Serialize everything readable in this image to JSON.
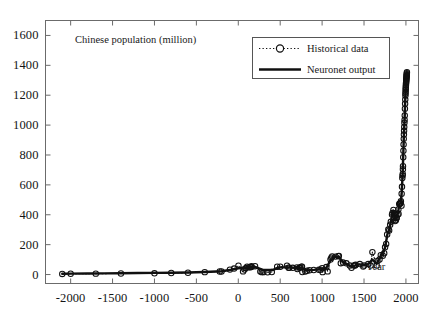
{
  "figure": {
    "background_color": "#ffffff",
    "axes_color": "#6b6b6b",
    "data_color": "#101010"
  },
  "chart_data": {
    "type": "line",
    "title": "Chinese population (million)",
    "xlabel": "Year",
    "ylabel": "",
    "xlim": [
      -2300,
      2150
    ],
    "ylim": [
      -60,
      1700
    ],
    "xticks": [
      -2000,
      -1500,
      -1000,
      -500,
      0,
      500,
      1000,
      1500,
      2000
    ],
    "xtick_labels": [
      "-2000",
      "-1500",
      "-1000",
      "-500",
      "0",
      "500",
      "1000",
      "1500",
      "2000"
    ],
    "yticks": [
      0,
      200,
      400,
      600,
      800,
      1000,
      1200,
      1400,
      1600
    ],
    "ytick_labels": [
      "0",
      "200",
      "400",
      "600",
      "800",
      "1000",
      "1200",
      "1400",
      "1600"
    ],
    "grid": false,
    "legend_position": "upper right",
    "legend": [
      {
        "name": "Historical data",
        "style": "dotted-line-with-circle-markers"
      },
      {
        "name": "Neuronet output",
        "style": "thick-solid-line"
      }
    ],
    "series": [
      {
        "name": "Historical data",
        "marker": "o",
        "linestyle": ":",
        "points": [
          [
            -2100,
            4
          ],
          [
            -2000,
            5
          ],
          [
            -1700,
            6
          ],
          [
            -1400,
            7
          ],
          [
            -1000,
            8
          ],
          [
            -800,
            10
          ],
          [
            -600,
            12
          ],
          [
            -400,
            16
          ],
          [
            -221,
            20
          ],
          [
            -200,
            20
          ],
          [
            -100,
            33
          ],
          [
            -50,
            40
          ],
          [
            2,
            59
          ],
          [
            57,
            21
          ],
          [
            75,
            34
          ],
          [
            88,
            43
          ],
          [
            105,
            53
          ],
          [
            125,
            48
          ],
          [
            140,
            49
          ],
          [
            156,
            50
          ],
          [
            157,
            56
          ],
          [
            200,
            56
          ],
          [
            263,
            21
          ],
          [
            280,
            16
          ],
          [
            300,
            16
          ],
          [
            350,
            15
          ],
          [
            400,
            17
          ],
          [
            464,
            52
          ],
          [
            500,
            52
          ],
          [
            581,
            59
          ],
          [
            600,
            46
          ],
          [
            609,
            46
          ],
          [
            650,
            45
          ],
          [
            700,
            48
          ],
          [
            705,
            37
          ],
          [
            732,
            45
          ],
          [
            740,
            48
          ],
          [
            755,
            52
          ],
          [
            760,
            53
          ],
          [
            764,
            17
          ],
          [
            800,
            20
          ],
          [
            820,
            25
          ],
          [
            850,
            29
          ],
          [
            900,
            30
          ],
          [
            961,
            32
          ],
          [
            980,
            32
          ],
          [
            1000,
            43
          ],
          [
            1006,
            16
          ],
          [
            1050,
            50
          ],
          [
            1066,
            21
          ],
          [
            1100,
            100
          ],
          [
            1110,
            112
          ],
          [
            1120,
            121
          ],
          [
            1160,
            120
          ],
          [
            1193,
            123
          ],
          [
            1200,
            125
          ],
          [
            1223,
            76
          ],
          [
            1250,
            80
          ],
          [
            1290,
            75
          ],
          [
            1330,
            60
          ],
          [
            1351,
            45
          ],
          [
            1381,
            60
          ],
          [
            1393,
            60
          ],
          [
            1400,
            65
          ],
          [
            1450,
            70
          ],
          [
            1491,
            53
          ],
          [
            1500,
            60
          ],
          [
            1550,
            70
          ],
          [
            1578,
            60
          ],
          [
            1600,
            150
          ],
          [
            1651,
            60
          ],
          [
            1661,
            91
          ],
          [
            1685,
            101
          ],
          [
            1700,
            130
          ],
          [
            1724,
            126
          ],
          [
            1741,
            143
          ],
          [
            1751,
            182
          ],
          [
            1764,
            205
          ],
          [
            1776,
            268
          ],
          [
            1790,
            301
          ],
          [
            1800,
            295
          ],
          [
            1812,
            333
          ],
          [
            1820,
            353
          ],
          [
            1834,
            401
          ],
          [
            1840,
            412
          ],
          [
            1851,
            432
          ],
          [
            1860,
            410
          ],
          [
            1870,
            358
          ],
          [
            1880,
            364
          ],
          [
            1887,
            377
          ],
          [
            1890,
            380
          ],
          [
            1900,
            400
          ],
          [
            1910,
            436
          ],
          [
            1912,
            405
          ],
          [
            1920,
            472
          ],
          [
            1928,
            474
          ],
          [
            1931,
            475
          ],
          [
            1936,
            479
          ],
          [
            1940,
            490
          ],
          [
            1947,
            461
          ],
          [
            1949,
            541
          ],
          [
            1953,
            587
          ],
          [
            1957,
            646
          ],
          [
            1960,
            662
          ],
          [
            1962,
            673
          ],
          [
            1964,
            705
          ],
          [
            1965,
            725
          ],
          [
            1968,
            785
          ],
          [
            1970,
            829
          ],
          [
            1972,
            871
          ],
          [
            1974,
            908
          ],
          [
            1976,
            937
          ],
          [
            1978,
            962
          ],
          [
            1980,
            987
          ],
          [
            1982,
            1016
          ],
          [
            1984,
            1034
          ],
          [
            1986,
            1065
          ],
          [
            1988,
            1110
          ],
          [
            1990,
            1143
          ],
          [
            1992,
            1171
          ],
          [
            1994,
            1198
          ],
          [
            1995,
            1211
          ],
          [
            1996,
            1223
          ],
          [
            1997,
            1236
          ],
          [
            1998,
            1247
          ],
          [
            1999,
            1257
          ],
          [
            2000,
            1267
          ],
          [
            2001,
            1276
          ],
          [
            2002,
            1284
          ],
          [
            2003,
            1292
          ],
          [
            2004,
            1299
          ],
          [
            2005,
            1307
          ],
          [
            2006,
            1314
          ],
          [
            2007,
            1321
          ],
          [
            2008,
            1328
          ],
          [
            2009,
            1334
          ],
          [
            2010,
            1340
          ],
          [
            2011,
            1347
          ],
          [
            2012,
            1354
          ]
        ]
      },
      {
        "name": "Neuronet output",
        "marker": "none",
        "linestyle": "-",
        "points": [
          [
            -2100,
            5
          ],
          [
            -2000,
            6
          ],
          [
            -1800,
            7
          ],
          [
            -1600,
            8
          ],
          [
            -1400,
            9
          ],
          [
            -1200,
            10
          ],
          [
            -1000,
            11
          ],
          [
            -800,
            12
          ],
          [
            -600,
            14
          ],
          [
            -400,
            17
          ],
          [
            -200,
            22
          ],
          [
            -100,
            30
          ],
          [
            0,
            42
          ],
          [
            100,
            47
          ],
          [
            200,
            51
          ],
          [
            300,
            30
          ],
          [
            400,
            30
          ],
          [
            500,
            48
          ],
          [
            600,
            48
          ],
          [
            700,
            44
          ],
          [
            750,
            48
          ],
          [
            800,
            28
          ],
          [
            900,
            31
          ],
          [
            1000,
            38
          ],
          [
            1050,
            45
          ],
          [
            1100,
            95
          ],
          [
            1150,
            118
          ],
          [
            1200,
            120
          ],
          [
            1250,
            82
          ],
          [
            1300,
            68
          ],
          [
            1350,
            52
          ],
          [
            1400,
            62
          ],
          [
            1450,
            68
          ],
          [
            1500,
            62
          ],
          [
            1550,
            70
          ],
          [
            1600,
            100
          ],
          [
            1650,
            72
          ],
          [
            1700,
            122
          ],
          [
            1750,
            178
          ],
          [
            1780,
            272
          ],
          [
            1800,
            300
          ],
          [
            1820,
            352
          ],
          [
            1840,
            410
          ],
          [
            1850,
            428
          ],
          [
            1860,
            408
          ],
          [
            1870,
            362
          ],
          [
            1880,
            368
          ],
          [
            1890,
            382
          ],
          [
            1900,
            402
          ],
          [
            1910,
            432
          ],
          [
            1920,
            468
          ],
          [
            1930,
            476
          ],
          [
            1940,
            490
          ],
          [
            1950,
            552
          ],
          [
            1960,
            662
          ],
          [
            1970,
            830
          ],
          [
            1975,
            920
          ],
          [
            1980,
            988
          ],
          [
            1985,
            1050
          ],
          [
            1990,
            1143
          ],
          [
            1995,
            1212
          ],
          [
            2000,
            1267
          ],
          [
            2005,
            1307
          ],
          [
            2010,
            1341
          ],
          [
            2012,
            1352
          ]
        ]
      }
    ]
  }
}
